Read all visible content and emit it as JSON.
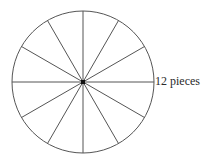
{
  "diagram": {
    "title": "",
    "shape": "circle",
    "pieces": 12,
    "label": "12 pieces",
    "stroke_color": "#555555",
    "center_dot_color": "#111111"
  }
}
